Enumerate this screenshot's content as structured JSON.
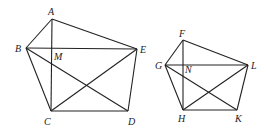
{
  "diagram": {
    "figures": [
      {
        "name": "pentagon-ABCDE",
        "points": {
          "A": [
            52,
            19
          ],
          "B": [
            26,
            48
          ],
          "C": [
            51,
            111
          ],
          "D": [
            128,
            111
          ],
          "E": [
            137,
            49
          ]
        },
        "intersection": {
          "M": [
            52,
            48
          ]
        },
        "labels": {
          "A": "A",
          "B": "B",
          "C": "C",
          "D": "D",
          "E": "E",
          "M": "M"
        }
      },
      {
        "name": "pentagon-FGHKL",
        "points": {
          "F": [
            183,
            40
          ],
          "G": [
            165,
            65
          ],
          "H": [
            183,
            110
          ],
          "K": [
            237,
            110
          ],
          "L": [
            248,
            65
          ]
        },
        "intersection": {
          "N": [
            183,
            65
          ]
        },
        "labels": {
          "F": "F",
          "G": "G",
          "H": "H",
          "K": "K",
          "L": "L",
          "N": "N"
        }
      }
    ]
  }
}
